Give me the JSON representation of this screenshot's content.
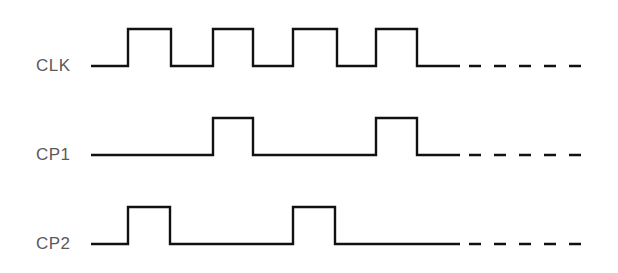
{
  "diagram": {
    "title": "",
    "type": "timing-diagram",
    "colors": {
      "line": "#111111",
      "label": "#5a5a5a",
      "background": "#ffffff"
    },
    "continuation": "dashed",
    "signals": [
      {
        "label": "CLK",
        "high_y": 29,
        "low_y": 66,
        "start_x": 91,
        "solid_end_x": 460,
        "dash_end_x": 582,
        "edges": [
          128,
          171,
          213,
          253,
          293,
          337,
          376,
          417
        ],
        "initial_level": "low"
      },
      {
        "label": "CP1",
        "high_y": 118,
        "low_y": 155,
        "start_x": 91,
        "solid_end_x": 460,
        "dash_end_x": 582,
        "edges": [
          213,
          253,
          376,
          417
        ],
        "initial_level": "low"
      },
      {
        "label": "CP2",
        "high_y": 207,
        "low_y": 244,
        "start_x": 91,
        "solid_end_x": 460,
        "dash_end_x": 582,
        "edges": [
          128,
          170,
          293,
          335
        ],
        "initial_level": "low"
      }
    ]
  }
}
